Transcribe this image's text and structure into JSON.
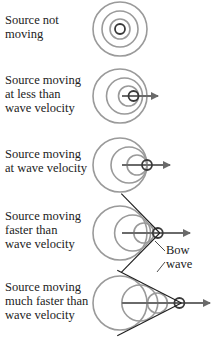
{
  "colors": {
    "wavefront": "#9a9a9a",
    "source": "#3a3a3a",
    "arrow": "#6a6a6a",
    "bow_line": "#1e1e1e",
    "text": "#222222"
  },
  "panels": [
    {
      "id": "not-moving",
      "label": "Source not\nmoving",
      "speed_ratio": 0,
      "has_arrow": false,
      "has_bow": false
    },
    {
      "id": "slower",
      "label": "Source moving\nat less than\nwave velocity",
      "speed_ratio": 0.5,
      "has_arrow": true,
      "has_bow": false
    },
    {
      "id": "equal",
      "label": "Source moving\nat wave velocity",
      "speed_ratio": 1,
      "has_arrow": true,
      "has_bow": false
    },
    {
      "id": "faster",
      "label": "Source moving\nfaster than\nwave velocity",
      "speed_ratio": 1.4,
      "has_arrow": true,
      "has_bow": true
    },
    {
      "id": "much-faster",
      "label": "Source moving\nmuch faster than\nwave velocity",
      "speed_ratio": 2.2,
      "has_arrow": true,
      "has_bow": true
    }
  ],
  "annotation": {
    "line1": "Bow",
    "line2": "wave"
  }
}
